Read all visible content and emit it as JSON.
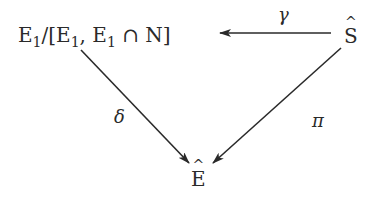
{
  "diagram": {
    "type": "commutative-diagram",
    "nodes": {
      "quotient": {
        "E": "E",
        "sub": "1",
        "slash": "/[",
        "E2": "E",
        "sub2": "1",
        "comma": ", ",
        "E3": "E",
        "sub3": "1",
        "cap": " ∩ N]"
      },
      "s_hat": "S",
      "e_hat": "E"
    },
    "arrows": [
      {
        "from": "S-hat",
        "to": "E1/[E1, E1 ∩ N]",
        "label": "γ"
      },
      {
        "from": "E1/[E1, E1 ∩ N]",
        "to": "E-hat",
        "label": "δ"
      },
      {
        "from": "S-hat",
        "to": "E-hat",
        "label": "π"
      }
    ],
    "labels": {
      "gamma": "γ",
      "delta": "δ",
      "pi": "π"
    },
    "colors": {
      "ink": "#2a2a2a",
      "background": "#ffffff"
    }
  }
}
